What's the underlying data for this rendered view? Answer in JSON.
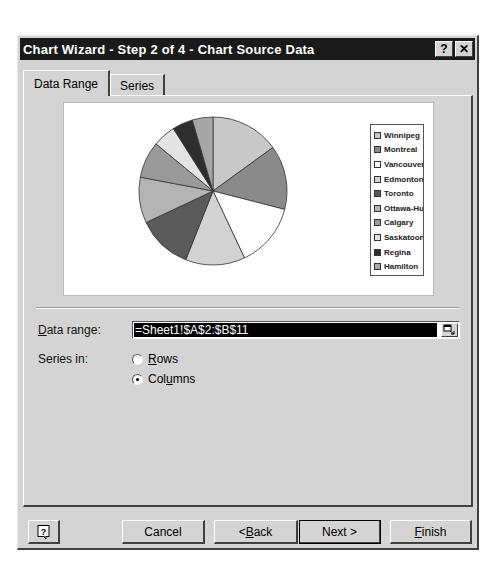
{
  "dialog": {
    "title": "Chart Wizard - Step 2 of 4 - Chart Source Data",
    "titlebar_buttons": {
      "help": "?",
      "close": "✕"
    }
  },
  "tabs": [
    {
      "label": "Data Range",
      "active": true
    },
    {
      "label": "Series",
      "active": false
    }
  ],
  "chart_data": {
    "type": "pie",
    "title": "",
    "categories": [
      "Winnipeg",
      "Montreal",
      "Vancouver",
      "Edmonton",
      "Toronto",
      "Ottawa-Hull",
      "Calgary",
      "Saskatoon",
      "Regina",
      "Hamilton"
    ],
    "values": [
      15,
      14,
      14,
      13,
      12,
      10,
      8,
      5,
      4.5,
      4.5
    ],
    "colors": [
      "#c8c8c8",
      "#8a8a8a",
      "#ffffff",
      "#d2d2d2",
      "#5a5a5a",
      "#b4b4b4",
      "#9a9a9a",
      "#e4e4e4",
      "#2e2e2e",
      "#a6a6a6"
    ],
    "legend_position": "right",
    "legend_labels_visible": [
      "Winnipeg",
      "Montreal",
      "Vancouver",
      "Edmonton",
      "Toronto",
      "Ottawa-Hull",
      "Calgary",
      "Saskatoon",
      "Regina",
      "Hamilton"
    ]
  },
  "form": {
    "data_range_label_prefix": "",
    "data_range_label_accel": "D",
    "data_range_label_rest": "ata range:",
    "data_range_value": "=Sheet1!$A$2:$B$11",
    "series_in_label": "Series in:",
    "rows_accel": "R",
    "rows_rest": "ows",
    "columns_pre": "Col",
    "columns_accel": "u",
    "columns_rest": "mns",
    "series_in_selected": "Columns"
  },
  "buttons": {
    "help": "?",
    "cancel": "Cancel",
    "back_pre": "< ",
    "back_accel": "B",
    "back_rest": "ack",
    "next": "Next >",
    "finish_accel": "F",
    "finish_rest": "inish"
  }
}
